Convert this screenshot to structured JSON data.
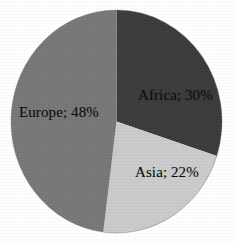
{
  "chart_data": {
    "type": "pie",
    "title": "",
    "subtitle": "",
    "xlabel": "",
    "ylabel": "",
    "legend_position": "none",
    "grid": false,
    "start_angle_deg": 0,
    "direction": "clockwise",
    "categories": [
      "Africa",
      "Asia",
      "Europe"
    ],
    "values": [
      30,
      22,
      48
    ],
    "value_unit": "%",
    "labels": [
      "Africa; 30%",
      "Asia; 22%",
      "Europe; 48%"
    ],
    "colors": [
      "#3a3a3a",
      "#cbcbcb",
      "#777777"
    ],
    "slices": [
      {
        "name": "Africa",
        "value": 30,
        "label": "Africa; 30%",
        "color": "#3a3a3a",
        "start_angle_deg": 0,
        "end_angle_deg": 108
      },
      {
        "name": "Asia",
        "value": 22,
        "label": "Asia; 22%",
        "color": "#cbcbcb",
        "start_angle_deg": 108,
        "end_angle_deg": 187.2
      },
      {
        "name": "Europe",
        "value": 48,
        "label": "Europe; 48%",
        "color": "#777777",
        "start_angle_deg": 187.2,
        "end_angle_deg": 360
      }
    ]
  },
  "figure": {
    "background_color": "#ffffff",
    "label_text_color": "#0a0a0a",
    "outline_color": "#5a5a5a"
  }
}
